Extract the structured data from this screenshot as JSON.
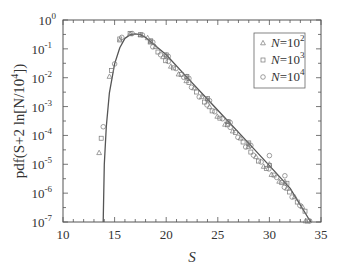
{
  "chart_data": {
    "type": "scatter",
    "title": "",
    "xlabel": "S",
    "ylabel": "pdf(S+2 ln[N/10^4])",
    "xlim": [
      10,
      35
    ],
    "ylim": [
      1e-07,
      1
    ],
    "yscale": "log",
    "xticks": [
      10,
      15,
      20,
      25,
      30,
      35
    ],
    "yticks": [
      "10^0",
      "10^-1",
      "10^-2",
      "10^-3",
      "10^-4",
      "10^-5",
      "10^-6",
      "10^-7"
    ],
    "grid": false,
    "legend_position": "upper right",
    "legend": [
      {
        "marker": "triangle",
        "label": "N=10^2"
      },
      {
        "marker": "square",
        "label": "N=10^3"
      },
      {
        "marker": "circle",
        "label": "N=10^4"
      }
    ],
    "curve": {
      "name": "theory",
      "x": [
        13.9,
        14.0,
        14.2,
        14.5,
        15.0,
        15.5,
        16.0,
        16.5,
        17.0,
        17.5,
        18.0,
        20.0,
        22.0,
        24.0,
        26.0,
        28.0,
        30.0,
        32.0,
        34.0
      ],
      "y": [
        1e-07,
        1e-05,
        0.0002,
        0.003,
        0.03,
        0.11,
        0.23,
        0.31,
        0.33,
        0.31,
        0.25,
        0.062,
        0.0105,
        0.0018,
        0.00031,
        5.3e-05,
        9e-06,
        1.5e-06,
        1e-07
      ]
    },
    "series": [
      {
        "name": "N=10^2",
        "marker": "triangle",
        "x": [
          13.5,
          14.5,
          15.5,
          16.5,
          17.5,
          18.5,
          20,
          22,
          24,
          26,
          28,
          30,
          31.5,
          33.5
        ],
        "y": [
          2.5e-05,
          0.011,
          0.2,
          0.33,
          0.3,
          0.18,
          0.06,
          0.011,
          0.0018,
          0.0003,
          5e-05,
          1e-05,
          2.5e-06,
          1e-07
        ]
      },
      {
        "name": "N=10^3",
        "marker": "square",
        "x": [
          13.7,
          14.7,
          15.5,
          16.5,
          17.5,
          18.5,
          20,
          22,
          24,
          26,
          28,
          30,
          31.7,
          33.7
        ],
        "y": [
          8e-05,
          0.018,
          0.22,
          0.34,
          0.31,
          0.19,
          0.062,
          0.011,
          0.0019,
          0.0003,
          5.5e-05,
          9e-06,
          2.2e-06,
          1e-07
        ]
      },
      {
        "name": "N=10^4",
        "marker": "circle",
        "x": [
          13.9,
          15.0,
          15.7,
          16.7,
          17.7,
          18.7,
          20.2,
          22.2,
          24.2,
          26.2,
          28.2,
          30.0,
          31.5,
          33.9
        ],
        "y": [
          0.0002,
          0.03,
          0.25,
          0.34,
          0.3,
          0.17,
          0.055,
          0.0095,
          0.0016,
          0.00028,
          4.5e-05,
          2e-05,
          4e-06,
          1e-07
        ]
      }
    ]
  },
  "axes": {
    "xlabel": "S",
    "ylabel_main": "pdf(S+2 ln[N/10",
    "ylabel_sup": "4",
    "ylabel_tail": "])",
    "xtick_labels": [
      "10",
      "15",
      "20",
      "25",
      "30",
      "35"
    ],
    "ytick_base": "10",
    "ytick_exps": [
      "0",
      "-1",
      "-2",
      "-3",
      "-4",
      "-5",
      "-6",
      "-7"
    ]
  },
  "legend": {
    "items": [
      {
        "prefix": "N=10",
        "exp": "2",
        "marker": "triangle"
      },
      {
        "prefix": "N=10",
        "exp": "3",
        "marker": "square"
      },
      {
        "prefix": "N=10",
        "exp": "4",
        "marker": "circle"
      }
    ]
  }
}
